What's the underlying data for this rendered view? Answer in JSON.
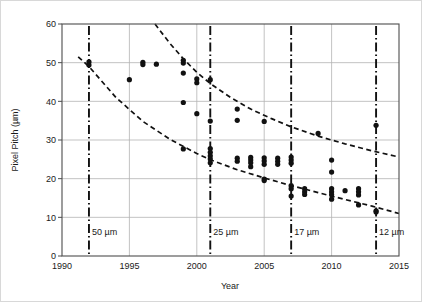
{
  "chart_data": {
    "type": "scatter",
    "title": "",
    "xlabel": "Year",
    "ylabel": "Pixel Pitch (µm)",
    "xlim": [
      1990,
      2015
    ],
    "ylim": [
      0,
      60
    ],
    "xticks": [
      1990,
      1995,
      2000,
      2005,
      2010,
      2015
    ],
    "yticks": [
      0,
      10,
      20,
      30,
      40,
      50,
      60
    ],
    "grid": true,
    "legend": "none",
    "marker": {
      "shape": "circle",
      "color": "#111111",
      "size": 4.6
    },
    "series": [
      {
        "name": "Pixel pitch data",
        "points": [
          {
            "x": 1992.0,
            "y": 50.2
          },
          {
            "x": 1992.0,
            "y": 49.4
          },
          {
            "x": 1995.0,
            "y": 45.6
          },
          {
            "x": 1996.0,
            "y": 50.1
          },
          {
            "x": 1996.0,
            "y": 49.5
          },
          {
            "x": 1997.0,
            "y": 49.6
          },
          {
            "x": 1999.0,
            "y": 50.6
          },
          {
            "x": 1999.0,
            "y": 49.9
          },
          {
            "x": 1999.0,
            "y": 47.3
          },
          {
            "x": 1999.0,
            "y": 39.7
          },
          {
            "x": 1999.0,
            "y": 27.7
          },
          {
            "x": 2000.0,
            "y": 45.8
          },
          {
            "x": 2000.0,
            "y": 44.8
          },
          {
            "x": 2000.0,
            "y": 36.8
          },
          {
            "x": 2001.0,
            "y": 45.6
          },
          {
            "x": 2001.0,
            "y": 34.9
          },
          {
            "x": 2001.0,
            "y": 27.8
          },
          {
            "x": 2001.0,
            "y": 26.8
          },
          {
            "x": 2001.0,
            "y": 25.9
          },
          {
            "x": 2001.0,
            "y": 25.1
          },
          {
            "x": 2001.0,
            "y": 24.1
          },
          {
            "x": 2003.0,
            "y": 38.0
          },
          {
            "x": 2003.0,
            "y": 35.1
          },
          {
            "x": 2003.0,
            "y": 25.3
          },
          {
            "x": 2003.0,
            "y": 24.5
          },
          {
            "x": 2004.0,
            "y": 25.5
          },
          {
            "x": 2004.0,
            "y": 24.8
          },
          {
            "x": 2004.0,
            "y": 24.1
          },
          {
            "x": 2004.0,
            "y": 23.1
          },
          {
            "x": 2005.0,
            "y": 34.8
          },
          {
            "x": 2005.0,
            "y": 25.4
          },
          {
            "x": 2005.0,
            "y": 24.6
          },
          {
            "x": 2005.0,
            "y": 23.7
          },
          {
            "x": 2005.0,
            "y": 19.9
          },
          {
            "x": 2005.0,
            "y": 19.5
          },
          {
            "x": 2006.0,
            "y": 25.3
          },
          {
            "x": 2006.0,
            "y": 24.5
          },
          {
            "x": 2006.0,
            "y": 23.7
          },
          {
            "x": 2007.0,
            "y": 25.6
          },
          {
            "x": 2007.0,
            "y": 24.8
          },
          {
            "x": 2007.0,
            "y": 24.0
          },
          {
            "x": 2007.0,
            "y": 18.2
          },
          {
            "x": 2007.0,
            "y": 17.4
          },
          {
            "x": 2007.0,
            "y": 15.5
          },
          {
            "x": 2008.0,
            "y": 17.4
          },
          {
            "x": 2008.0,
            "y": 16.6
          },
          {
            "x": 2008.0,
            "y": 15.9
          },
          {
            "x": 2009.0,
            "y": 31.7
          },
          {
            "x": 2010.0,
            "y": 24.8
          },
          {
            "x": 2010.0,
            "y": 21.7
          },
          {
            "x": 2010.0,
            "y": 17.4
          },
          {
            "x": 2010.0,
            "y": 16.6
          },
          {
            "x": 2010.0,
            "y": 15.9
          },
          {
            "x": 2010.0,
            "y": 14.7
          },
          {
            "x": 2011.0,
            "y": 16.9
          },
          {
            "x": 2012.0,
            "y": 17.4
          },
          {
            "x": 2012.0,
            "y": 16.6
          },
          {
            "x": 2012.0,
            "y": 15.8
          },
          {
            "x": 2012.0,
            "y": 13.2
          },
          {
            "x": 2013.3,
            "y": 33.8
          },
          {
            "x": 2013.3,
            "y": 11.7
          },
          {
            "x": 2013.3,
            "y": 11.4
          }
        ]
      }
    ],
    "trend_curves": [
      {
        "name": "upper-trend",
        "style": "dashed",
        "points": [
          {
            "x": 1996.9,
            "y": 60.0
          },
          {
            "x": 1998.0,
            "y": 55.0
          },
          {
            "x": 1999.0,
            "y": 51.0
          },
          {
            "x": 2000.0,
            "y": 47.5
          },
          {
            "x": 2001.0,
            "y": 44.6
          },
          {
            "x": 2002.5,
            "y": 41.0
          },
          {
            "x": 2004.0,
            "y": 38.0
          },
          {
            "x": 2005.5,
            "y": 35.6
          },
          {
            "x": 2007.0,
            "y": 33.4
          },
          {
            "x": 2009.0,
            "y": 31.0
          },
          {
            "x": 2011.0,
            "y": 29.0
          },
          {
            "x": 2013.0,
            "y": 27.2
          },
          {
            "x": 2015.0,
            "y": 25.6
          }
        ]
      },
      {
        "name": "lower-trend",
        "style": "dashed",
        "points": [
          {
            "x": 1991.2,
            "y": 51.5
          },
          {
            "x": 1992.0,
            "y": 49.0
          },
          {
            "x": 1994.0,
            "y": 41.0
          },
          {
            "x": 1996.0,
            "y": 34.8
          },
          {
            "x": 1998.0,
            "y": 30.2
          },
          {
            "x": 2000.0,
            "y": 26.5
          },
          {
            "x": 2001.0,
            "y": 24.9
          },
          {
            "x": 2003.0,
            "y": 22.3
          },
          {
            "x": 2005.0,
            "y": 20.2
          },
          {
            "x": 2007.0,
            "y": 18.2
          },
          {
            "x": 2009.0,
            "y": 16.4
          },
          {
            "x": 2011.0,
            "y": 14.6
          },
          {
            "x": 2013.0,
            "y": 12.9
          },
          {
            "x": 2015.0,
            "y": 11.0
          }
        ]
      }
    ],
    "annotations": [
      {
        "label": "50 µm",
        "x": 1992.0,
        "style": "dash-dot-vertical"
      },
      {
        "label": "25 µm",
        "x": 2001.0,
        "style": "dash-dot-vertical"
      },
      {
        "label": "17 µm",
        "x": 2007.0,
        "style": "dash-dot-vertical"
      },
      {
        "label": "12 µm",
        "x": 2013.3,
        "style": "dash-dot-vertical"
      }
    ],
    "colors": {
      "marker": "#111111",
      "trend": "#111111",
      "grid": "#b4b4b4",
      "axis": "#4d4d4d",
      "annotation_line": "#111111",
      "frame": "#d8d8d8",
      "background": "#ffffff"
    }
  }
}
